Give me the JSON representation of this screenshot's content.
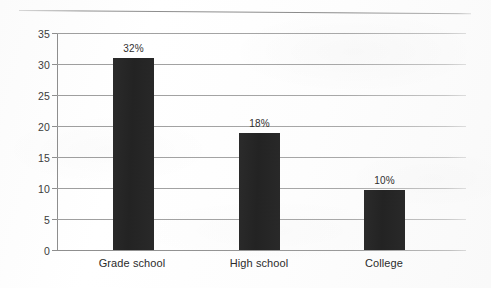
{
  "chart_data": {
    "type": "bar",
    "title": "",
    "subtitle": "",
    "xlabel": "",
    "ylabel": "",
    "categories": [
      "Grade school",
      "High school",
      "College"
    ],
    "values": [
      31,
      18.8,
      9.7
    ],
    "data_labels": [
      "32%",
      "18%",
      "10%"
    ],
    "ylim": [
      0,
      35
    ],
    "ytick_labels": [
      "35",
      "30",
      "25",
      "20",
      "15",
      "10",
      "5",
      "0"
    ],
    "ytick_values": [
      35,
      30,
      25,
      20,
      15,
      10,
      5,
      0
    ],
    "ytick_step": 5,
    "grid": true,
    "grid_axis": "y",
    "legend": false,
    "legend_position": "none",
    "bar_color": "#262626",
    "gridline_color": "#a3a3a3",
    "axis_color": "#8e8e8e",
    "text_color": "#2b2b2b",
    "background_color": "#ffffff"
  }
}
